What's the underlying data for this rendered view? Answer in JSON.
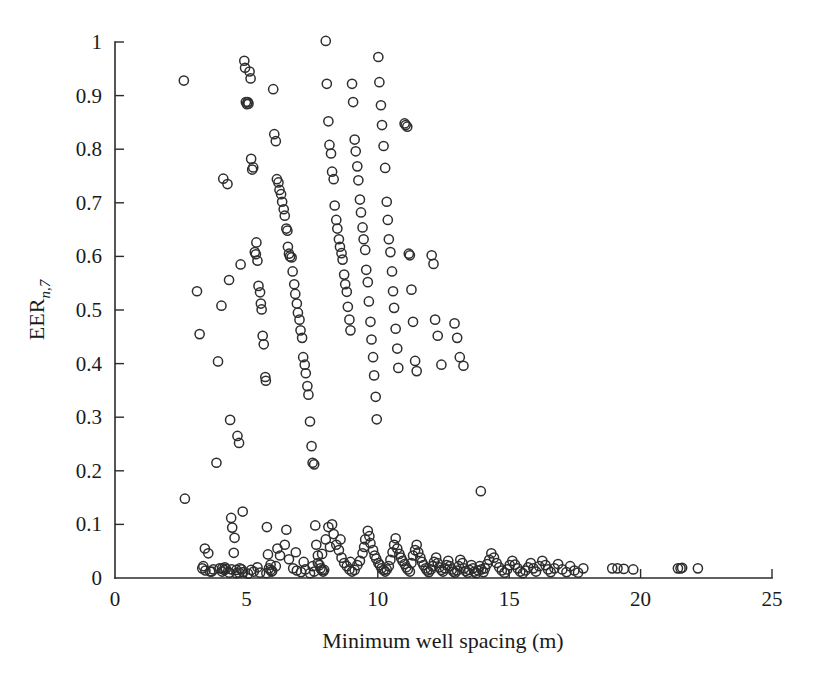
{
  "figure": {
    "background_color": "#ffffff",
    "marker_color": "#2e2e2e",
    "axis_color": "#2b2b2b",
    "marker_radius_px": 4.6
  },
  "chart_data": {
    "type": "scatter",
    "title": "",
    "xlabel": "Minimum well spacing (m)",
    "ylabel_main": "EER",
    "ylabel_sub": "n,7",
    "xlim": [
      0,
      25
    ],
    "ylim": [
      0,
      1
    ],
    "xticks": [
      0,
      5,
      10,
      15,
      20,
      25
    ],
    "xticklabels": [
      "0",
      "5",
      "10",
      "15",
      "20",
      "25"
    ],
    "yticks": [
      0,
      0.1,
      0.2,
      0.3,
      0.4,
      0.5,
      0.6,
      0.7,
      0.8,
      0.9,
      1
    ],
    "yticklabels": [
      "0",
      "0.1",
      "0.2",
      "0.3",
      "0.4",
      "0.5",
      "0.6",
      "0.7",
      "0.8",
      "0.9",
      "1"
    ],
    "grid": false,
    "legend": null,
    "marker_style": "open-circle",
    "n_points": 330,
    "points": [
      [
        2.62,
        0.928
      ],
      [
        2.66,
        0.148
      ],
      [
        3.12,
        0.535
      ],
      [
        3.22,
        0.455
      ],
      [
        3.36,
        0.022
      ],
      [
        3.42,
        0.055
      ],
      [
        3.55,
        0.046
      ],
      [
        3.62,
        0.012
      ],
      [
        3.74,
        0.016
      ],
      [
        3.86,
        0.215
      ],
      [
        3.92,
        0.404
      ],
      [
        3.98,
        0.018
      ],
      [
        4.05,
        0.508
      ],
      [
        4.08,
        0.018
      ],
      [
        4.12,
        0.745
      ],
      [
        4.16,
        0.015
      ],
      [
        4.22,
        0.017
      ],
      [
        4.28,
        0.735
      ],
      [
        4.34,
        0.556
      ],
      [
        4.38,
        0.295
      ],
      [
        4.42,
        0.112
      ],
      [
        4.46,
        0.094
      ],
      [
        4.52,
        0.047
      ],
      [
        4.55,
        0.075
      ],
      [
        4.62,
        0.015
      ],
      [
        4.66,
        0.265
      ],
      [
        4.72,
        0.252
      ],
      [
        4.75,
        0.018
      ],
      [
        4.78,
        0.585
      ],
      [
        4.82,
        0.016
      ],
      [
        4.86,
        0.124
      ],
      [
        4.92,
        0.965
      ],
      [
        4.95,
        0.952
      ],
      [
        4.98,
        0.888
      ],
      [
        5.02,
        0.884
      ],
      [
        5.05,
        0.888
      ],
      [
        5.08,
        0.885
      ],
      [
        5.12,
        0.945
      ],
      [
        5.16,
        0.932
      ],
      [
        5.18,
        0.782
      ],
      [
        5.22,
        0.762
      ],
      [
        5.26,
        0.766
      ],
      [
        5.32,
        0.608
      ],
      [
        5.36,
        0.604
      ],
      [
        5.38,
        0.626
      ],
      [
        5.42,
        0.592
      ],
      [
        5.46,
        0.545
      ],
      [
        5.52,
        0.533
      ],
      [
        5.55,
        0.512
      ],
      [
        5.58,
        0.501
      ],
      [
        5.62,
        0.452
      ],
      [
        5.66,
        0.436
      ],
      [
        5.72,
        0.375
      ],
      [
        5.74,
        0.368
      ],
      [
        5.78,
        0.095
      ],
      [
        5.82,
        0.044
      ],
      [
        5.86,
        0.018
      ],
      [
        5.92,
        0.015
      ],
      [
        5.96,
        0.012
      ],
      [
        6.02,
        0.912
      ],
      [
        6.06,
        0.828
      ],
      [
        6.12,
        0.815
      ],
      [
        6.16,
        0.744
      ],
      [
        6.22,
        0.738
      ],
      [
        6.26,
        0.724
      ],
      [
        6.32,
        0.716
      ],
      [
        6.36,
        0.702
      ],
      [
        6.42,
        0.688
      ],
      [
        6.46,
        0.676
      ],
      [
        6.52,
        0.652
      ],
      [
        6.56,
        0.648
      ],
      [
        6.58,
        0.618
      ],
      [
        6.62,
        0.605
      ],
      [
        6.66,
        0.6
      ],
      [
        6.72,
        0.598
      ],
      [
        6.76,
        0.572
      ],
      [
        6.82,
        0.548
      ],
      [
        6.86,
        0.53
      ],
      [
        6.92,
        0.512
      ],
      [
        6.96,
        0.495
      ],
      [
        7.02,
        0.482
      ],
      [
        7.06,
        0.462
      ],
      [
        7.12,
        0.448
      ],
      [
        7.16,
        0.412
      ],
      [
        7.22,
        0.398
      ],
      [
        7.26,
        0.382
      ],
      [
        7.32,
        0.358
      ],
      [
        7.36,
        0.342
      ],
      [
        7.42,
        0.292
      ],
      [
        7.48,
        0.246
      ],
      [
        7.52,
        0.215
      ],
      [
        7.58,
        0.212
      ],
      [
        7.62,
        0.098
      ],
      [
        7.66,
        0.062
      ],
      [
        7.72,
        0.042
      ],
      [
        7.78,
        0.024
      ],
      [
        7.82,
        0.018
      ],
      [
        7.88,
        0.015
      ],
      [
        7.92,
        0.012
      ],
      [
        7.96,
        0.015
      ],
      [
        8.02,
        1.002
      ],
      [
        8.06,
        0.922
      ],
      [
        8.12,
        0.852
      ],
      [
        8.16,
        0.808
      ],
      [
        8.22,
        0.792
      ],
      [
        8.26,
        0.758
      ],
      [
        8.32,
        0.744
      ],
      [
        8.36,
        0.695
      ],
      [
        8.42,
        0.668
      ],
      [
        8.46,
        0.652
      ],
      [
        8.52,
        0.632
      ],
      [
        8.56,
        0.618
      ],
      [
        8.62,
        0.606
      ],
      [
        8.66,
        0.594
      ],
      [
        8.72,
        0.566
      ],
      [
        8.76,
        0.548
      ],
      [
        8.82,
        0.534
      ],
      [
        8.86,
        0.506
      ],
      [
        8.92,
        0.482
      ],
      [
        8.96,
        0.462
      ],
      [
        9.02,
        0.922
      ],
      [
        9.06,
        0.888
      ],
      [
        9.12,
        0.818
      ],
      [
        9.16,
        0.796
      ],
      [
        9.22,
        0.768
      ],
      [
        9.26,
        0.742
      ],
      [
        9.32,
        0.706
      ],
      [
        9.36,
        0.682
      ],
      [
        9.42,
        0.654
      ],
      [
        9.46,
        0.632
      ],
      [
        9.52,
        0.612
      ],
      [
        9.56,
        0.575
      ],
      [
        9.62,
        0.552
      ],
      [
        9.66,
        0.516
      ],
      [
        9.72,
        0.478
      ],
      [
        9.76,
        0.445
      ],
      [
        9.82,
        0.412
      ],
      [
        9.86,
        0.378
      ],
      [
        9.92,
        0.338
      ],
      [
        9.96,
        0.296
      ],
      [
        10.02,
        0.972
      ],
      [
        10.06,
        0.925
      ],
      [
        10.12,
        0.882
      ],
      [
        10.16,
        0.845
      ],
      [
        10.22,
        0.806
      ],
      [
        10.28,
        0.765
      ],
      [
        10.34,
        0.702
      ],
      [
        10.38,
        0.668
      ],
      [
        10.42,
        0.632
      ],
      [
        10.48,
        0.608
      ],
      [
        10.54,
        0.572
      ],
      [
        10.58,
        0.535
      ],
      [
        10.62,
        0.504
      ],
      [
        10.68,
        0.465
      ],
      [
        10.74,
        0.428
      ],
      [
        10.78,
        0.392
      ],
      [
        11.02,
        0.848
      ],
      [
        11.06,
        0.845
      ],
      [
        11.12,
        0.842
      ],
      [
        11.18,
        0.605
      ],
      [
        11.22,
        0.602
      ],
      [
        11.28,
        0.538
      ],
      [
        11.34,
        0.478
      ],
      [
        11.42,
        0.405
      ],
      [
        11.48,
        0.386
      ],
      [
        12.05,
        0.602
      ],
      [
        12.12,
        0.586
      ],
      [
        12.18,
        0.482
      ],
      [
        12.28,
        0.452
      ],
      [
        12.42,
        0.398
      ],
      [
        12.92,
        0.475
      ],
      [
        13.02,
        0.448
      ],
      [
        13.12,
        0.412
      ],
      [
        13.26,
        0.396
      ],
      [
        13.92,
        0.162
      ],
      [
        4.08,
        0.012
      ],
      [
        4.35,
        0.01
      ],
      [
        4.62,
        0.009
      ],
      [
        4.88,
        0.011
      ],
      [
        5.06,
        0.008
      ],
      [
        5.28,
        0.012
      ],
      [
        5.52,
        0.01
      ],
      [
        5.76,
        0.009
      ],
      [
        5.98,
        0.013
      ],
      [
        6.12,
        0.022
      ],
      [
        6.28,
        0.042
      ],
      [
        6.46,
        0.062
      ],
      [
        6.62,
        0.035
      ],
      [
        6.78,
        0.018
      ],
      [
        6.92,
        0.014
      ],
      [
        7.08,
        0.011
      ],
      [
        7.24,
        0.016
      ],
      [
        7.42,
        0.009
      ],
      [
        7.58,
        0.012
      ],
      [
        7.72,
        0.028
      ],
      [
        7.88,
        0.045
      ],
      [
        8.02,
        0.072
      ],
      [
        8.18,
        0.058
      ],
      [
        8.32,
        0.082
      ],
      [
        8.42,
        0.062
      ],
      [
        8.52,
        0.052
      ],
      [
        8.62,
        0.038
      ],
      [
        8.72,
        0.028
      ],
      [
        8.82,
        0.022
      ],
      [
        8.92,
        0.016
      ],
      [
        9.02,
        0.012
      ],
      [
        9.12,
        0.015
      ],
      [
        9.22,
        0.024
      ],
      [
        9.32,
        0.032
      ],
      [
        9.42,
        0.046
      ],
      [
        9.52,
        0.072
      ],
      [
        9.62,
        0.088
      ],
      [
        9.72,
        0.065
      ],
      [
        9.82,
        0.052
      ],
      [
        9.88,
        0.042
      ],
      [
        9.94,
        0.036
      ],
      [
        10.02,
        0.028
      ],
      [
        10.08,
        0.024
      ],
      [
        10.14,
        0.018
      ],
      [
        10.22,
        0.015
      ],
      [
        10.28,
        0.012
      ],
      [
        10.34,
        0.016
      ],
      [
        10.42,
        0.022
      ],
      [
        10.48,
        0.034
      ],
      [
        10.56,
        0.048
      ],
      [
        10.62,
        0.062
      ],
      [
        10.68,
        0.074
      ],
      [
        10.74,
        0.055
      ],
      [
        10.82,
        0.045
      ],
      [
        10.88,
        0.038
      ],
      [
        10.94,
        0.032
      ],
      [
        11.02,
        0.026
      ],
      [
        11.08,
        0.02
      ],
      [
        11.14,
        0.016
      ],
      [
        11.22,
        0.012
      ],
      [
        11.28,
        0.028
      ],
      [
        11.34,
        0.042
      ],
      [
        11.42,
        0.052
      ],
      [
        11.48,
        0.062
      ],
      [
        11.54,
        0.048
      ],
      [
        11.62,
        0.038
      ],
      [
        11.68,
        0.03
      ],
      [
        11.74,
        0.024
      ],
      [
        11.82,
        0.018
      ],
      [
        11.88,
        0.014
      ],
      [
        11.94,
        0.011
      ],
      [
        12.02,
        0.016
      ],
      [
        12.08,
        0.022
      ],
      [
        12.14,
        0.03
      ],
      [
        12.22,
        0.038
      ],
      [
        12.28,
        0.028
      ],
      [
        12.34,
        0.02
      ],
      [
        12.42,
        0.015
      ],
      [
        12.48,
        0.012
      ],
      [
        12.56,
        0.018
      ],
      [
        12.62,
        0.024
      ],
      [
        12.68,
        0.032
      ],
      [
        12.74,
        0.022
      ],
      [
        12.82,
        0.016
      ],
      [
        12.88,
        0.012
      ],
      [
        12.94,
        0.01
      ],
      [
        13.02,
        0.014
      ],
      [
        13.08,
        0.022
      ],
      [
        13.14,
        0.034
      ],
      [
        13.22,
        0.028
      ],
      [
        13.28,
        0.018
      ],
      [
        13.34,
        0.013
      ],
      [
        13.42,
        0.01
      ],
      [
        13.48,
        0.015
      ],
      [
        13.56,
        0.024
      ],
      [
        13.62,
        0.018
      ],
      [
        13.68,
        0.012
      ],
      [
        13.74,
        0.009
      ],
      [
        13.82,
        0.014
      ],
      [
        13.88,
        0.022
      ],
      [
        13.94,
        0.016
      ],
      [
        14.02,
        0.011
      ],
      [
        14.08,
        0.018
      ],
      [
        14.16,
        0.026
      ],
      [
        14.24,
        0.034
      ],
      [
        14.32,
        0.046
      ],
      [
        14.42,
        0.038
      ],
      [
        14.52,
        0.028
      ],
      [
        14.62,
        0.02
      ],
      [
        14.72,
        0.014
      ],
      [
        14.82,
        0.01
      ],
      [
        14.92,
        0.016
      ],
      [
        15.02,
        0.024
      ],
      [
        15.12,
        0.032
      ],
      [
        15.22,
        0.025
      ],
      [
        15.32,
        0.018
      ],
      [
        15.42,
        0.012
      ],
      [
        15.52,
        0.009
      ],
      [
        15.62,
        0.014
      ],
      [
        15.72,
        0.02
      ],
      [
        15.82,
        0.028
      ],
      [
        15.92,
        0.018
      ],
      [
        16.02,
        0.012
      ],
      [
        16.14,
        0.022
      ],
      [
        16.26,
        0.032
      ],
      [
        16.38,
        0.024
      ],
      [
        16.48,
        0.016
      ],
      [
        16.58,
        0.011
      ],
      [
        16.72,
        0.018
      ],
      [
        16.86,
        0.026
      ],
      [
        17.02,
        0.016
      ],
      [
        17.18,
        0.011
      ],
      [
        17.32,
        0.022
      ],
      [
        17.48,
        0.014
      ],
      [
        17.62,
        0.01
      ],
      [
        17.82,
        0.018
      ],
      [
        18.92,
        0.018
      ],
      [
        19.12,
        0.018
      ],
      [
        19.36,
        0.017
      ],
      [
        19.72,
        0.016
      ],
      [
        21.42,
        0.018
      ],
      [
        21.52,
        0.018
      ],
      [
        21.58,
        0.019
      ],
      [
        22.18,
        0.018
      ],
      [
        3.32,
        0.018
      ],
      [
        3.44,
        0.014
      ],
      [
        3.68,
        0.012
      ],
      [
        4.18,
        0.02
      ],
      [
        4.44,
        0.016
      ],
      [
        4.72,
        0.01
      ],
      [
        5.18,
        0.015
      ],
      [
        5.42,
        0.02
      ],
      [
        5.92,
        0.025
      ],
      [
        6.18,
        0.055
      ],
      [
        6.52,
        0.09
      ],
      [
        6.88,
        0.048
      ],
      [
        7.18,
        0.03
      ],
      [
        7.52,
        0.022
      ],
      [
        8.12,
        0.095
      ],
      [
        8.26,
        0.1
      ],
      [
        8.58,
        0.072
      ],
      [
        8.96,
        0.03
      ],
      [
        9.48,
        0.058
      ],
      [
        9.68,
        0.078
      ]
    ]
  }
}
